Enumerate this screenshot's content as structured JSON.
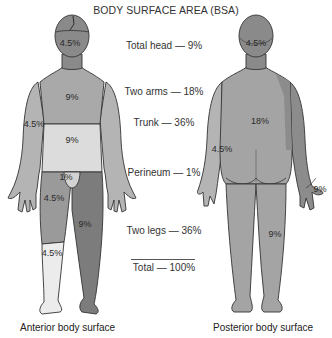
{
  "title": "BODY SURFACE AREA (BSA)",
  "legend": [
    {
      "region": "Total head",
      "value": "9%",
      "text": "Total head — 9%"
    },
    {
      "region": "Two arms",
      "value": "18%",
      "text": "Two arms — 18%"
    },
    {
      "region": "Trunk",
      "value": "36%",
      "text": "Trunk — 36%"
    },
    {
      "region": "Perineum",
      "value": "1%",
      "text": "Perineum — 1%"
    },
    {
      "region": "Two legs",
      "value": "36%",
      "text": "Two legs — 36%"
    },
    {
      "region": "Total",
      "value": "100%",
      "text": "Total — 100%"
    }
  ],
  "anterior": {
    "caption": "Anterior body surface",
    "labels": {
      "head": "4.5%",
      "chest": "9%",
      "arm": "4.5%",
      "abdomen": "9%",
      "perineum": "1%",
      "thigh": "4.5%",
      "lower_leg": "4.5%",
      "right_leg": "9%"
    }
  },
  "posterior": {
    "caption": "Posterior body surface",
    "labels": {
      "head": "4.5%",
      "back": "18%",
      "arm": "4.5%",
      "right_arm": "9%",
      "leg": "9%"
    }
  },
  "colors": {
    "head": "#8a8a8a",
    "chest": "#a9a9a9",
    "abdomen": "#dcdcdc",
    "thigh": "#9a9a9a",
    "lower_leg": "#ececec",
    "full_leg": "#7c7c7c",
    "arm": "#b4b4b4",
    "back": "#a4a4a4",
    "outline": "#333333"
  }
}
